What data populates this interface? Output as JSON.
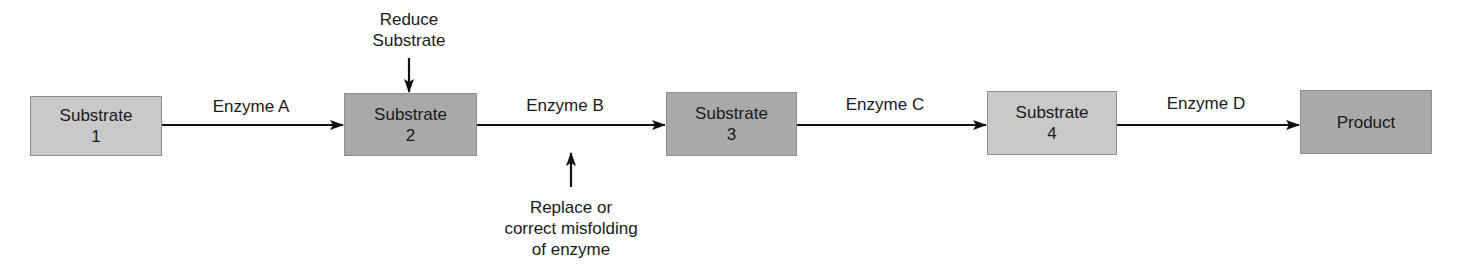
{
  "diagram": {
    "type": "metabolic-pathway-flow",
    "nodes": [
      {
        "id": "substrate-1",
        "line1": "Substrate",
        "line2": "1",
        "shade": "light"
      },
      {
        "id": "substrate-2",
        "line1": "Substrate",
        "line2": "2",
        "shade": "dark"
      },
      {
        "id": "substrate-3",
        "line1": "Substrate",
        "line2": "3",
        "shade": "dark"
      },
      {
        "id": "substrate-4",
        "line1": "Substrate",
        "line2": "4",
        "shade": "light"
      },
      {
        "id": "product",
        "line1": "Product",
        "line2": "",
        "shade": "dark"
      }
    ],
    "edges": [
      {
        "from": "substrate-1",
        "to": "substrate-2",
        "label": "Enzyme A"
      },
      {
        "from": "substrate-2",
        "to": "substrate-3",
        "label": "Enzyme B"
      },
      {
        "from": "substrate-3",
        "to": "substrate-4",
        "label": "Enzyme C"
      },
      {
        "from": "substrate-4",
        "to": "product",
        "label": "Enzyme D"
      }
    ],
    "interventions": [
      {
        "target": "substrate-2",
        "direction": "down",
        "line1": "Reduce",
        "line2": "Substrate"
      },
      {
        "target": "enzyme-b-edge",
        "direction": "up",
        "line1": "Replace or",
        "line2": "correct misfolding",
        "line3": "of enzyme"
      }
    ],
    "colors": {
      "light_box": "#c9c9c9",
      "dark_box": "#a9a9a9",
      "border": "#8e8e8e",
      "arrow": "#111111"
    }
  }
}
